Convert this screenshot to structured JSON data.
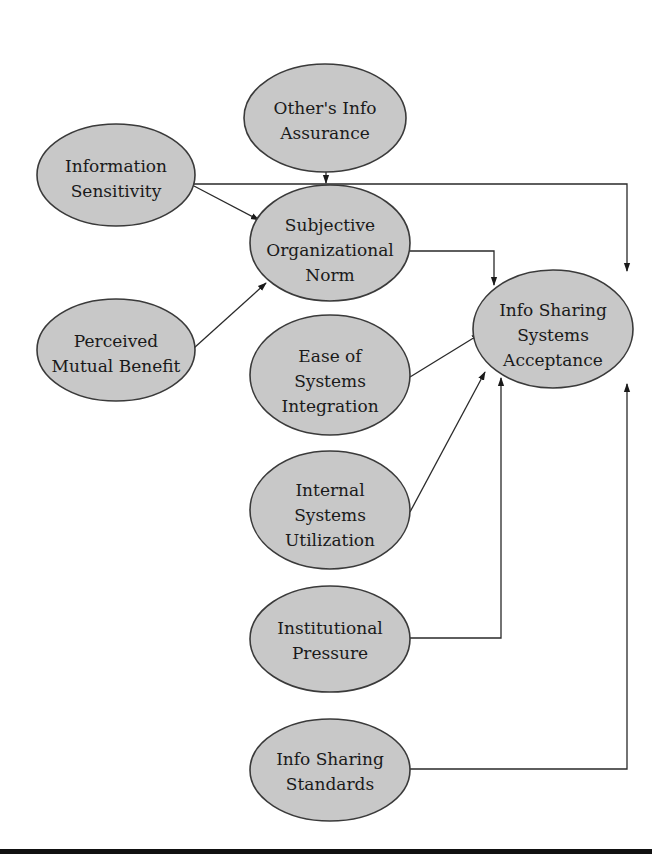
{
  "diagram": {
    "type": "path-model",
    "colors": {
      "node_fill": "#c8c8c8",
      "node_stroke": "#3a3a3a",
      "edge": "#2a2a2a",
      "rule": "#111111"
    },
    "nodes": [
      {
        "id": "others_info_assurance",
        "lines": [
          "Other's Info",
          "Assurance"
        ]
      },
      {
        "id": "information_sensitivity",
        "lines": [
          "Information",
          "Sensitivity"
        ]
      },
      {
        "id": "subjective_organizational_norm",
        "lines": [
          "Subjective",
          "Organizational",
          "Norm"
        ]
      },
      {
        "id": "perceived_mutual_benefit",
        "lines": [
          "Perceived",
          "Mutual Benefit"
        ]
      },
      {
        "id": "info_sharing_systems_acceptance",
        "lines": [
          "Info Sharing",
          "Systems",
          "Acceptance"
        ]
      },
      {
        "id": "ease_of_systems_integration",
        "lines": [
          "Ease of",
          "Systems",
          "Integration"
        ]
      },
      {
        "id": "internal_systems_utilization",
        "lines": [
          "Internal",
          "Systems",
          "Utilization"
        ]
      },
      {
        "id": "institutional_pressure",
        "lines": [
          "Institutional",
          "Pressure"
        ]
      },
      {
        "id": "info_sharing_standards",
        "lines": [
          "Info Sharing",
          "Standards"
        ]
      }
    ],
    "edges": [
      {
        "from": "others_info_assurance",
        "to": "information_sensitivity->info_sharing_systems_acceptance line"
      },
      {
        "from": "information_sensitivity",
        "to": "subjective_organizational_norm"
      },
      {
        "from": "information_sensitivity",
        "to": "info_sharing_systems_acceptance"
      },
      {
        "from": "perceived_mutual_benefit",
        "to": "subjective_organizational_norm"
      },
      {
        "from": "subjective_organizational_norm",
        "to": "info_sharing_systems_acceptance"
      },
      {
        "from": "ease_of_systems_integration",
        "to": "info_sharing_systems_acceptance"
      },
      {
        "from": "internal_systems_utilization",
        "to": "info_sharing_systems_acceptance"
      },
      {
        "from": "institutional_pressure",
        "to": "info_sharing_systems_acceptance"
      },
      {
        "from": "info_sharing_standards",
        "to": "info_sharing_systems_acceptance"
      }
    ]
  }
}
